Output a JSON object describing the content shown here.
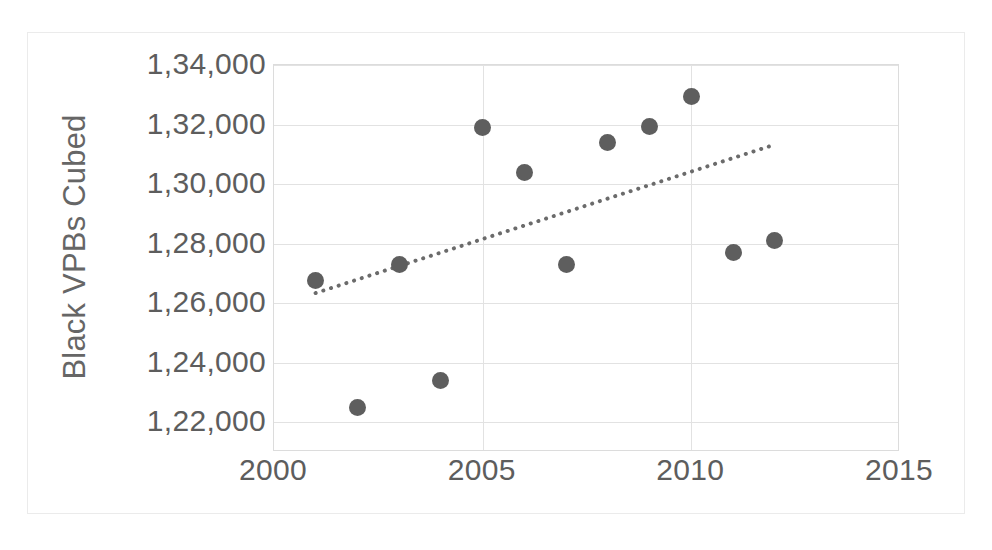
{
  "chart_data": {
    "type": "scatter",
    "title": "",
    "subtitle": "",
    "xlabel": "",
    "ylabel": "Black VPBs Cubed",
    "x": [
      2001,
      2002,
      2003,
      2004,
      2005,
      2006,
      2007,
      2008,
      2009,
      2010,
      2011,
      2012
    ],
    "values": [
      126750,
      122500,
      127300,
      123400,
      131900,
      130400,
      127300,
      131400,
      131950,
      132950,
      127700,
      128100
    ],
    "series": [
      {
        "name": "Black VPBs Cubed",
        "points": [
          {
            "x": 2001,
            "y": 126750
          },
          {
            "x": 2002,
            "y": 122500
          },
          {
            "x": 2003,
            "y": 127300
          },
          {
            "x": 2004,
            "y": 123400
          },
          {
            "x": 2005,
            "y": 131900
          },
          {
            "x": 2006,
            "y": 130400
          },
          {
            "x": 2007,
            "y": 127300
          },
          {
            "x": 2008,
            "y": 131400
          },
          {
            "x": 2009,
            "y": 131950
          },
          {
            "x": 2010,
            "y": 132950
          },
          {
            "x": 2011,
            "y": 127700
          },
          {
            "x": 2012,
            "y": 128100
          }
        ]
      }
    ],
    "trendline": {
      "type": "linear",
      "style": "dotted",
      "color": "#6b6b6b",
      "start": {
        "x": 2001.0,
        "y": 126300
      },
      "end": {
        "x": 2011.9,
        "y": 131250
      }
    },
    "xlim": [
      2000,
      2015
    ],
    "ylim": [
      121000,
      134000
    ],
    "xticks": [
      2000,
      2005,
      2010,
      2015
    ],
    "xticklabels": [
      "2000",
      "2005",
      "2010",
      "2015"
    ],
    "yticks": [
      122000,
      124000,
      126000,
      128000,
      130000,
      132000,
      134000
    ],
    "yticklabels": [
      "1,22,000",
      "1,24,000",
      "1,26,000",
      "1,28,000",
      "1,30,000",
      "1,32,000",
      "1,34,000"
    ],
    "grid": {
      "horizontal": true,
      "vertical": true
    },
    "legend": {
      "visible": false,
      "position": "none"
    },
    "colors": {
      "marker": "#5e5e5e",
      "gridline": "#e2e2e2",
      "axis": "#dcdcdc",
      "text": "#5d5d5d",
      "frame": "#ebebeb",
      "background": "#ffffff"
    }
  },
  "axes": {
    "y_title": "Black VPBs Cubed"
  }
}
